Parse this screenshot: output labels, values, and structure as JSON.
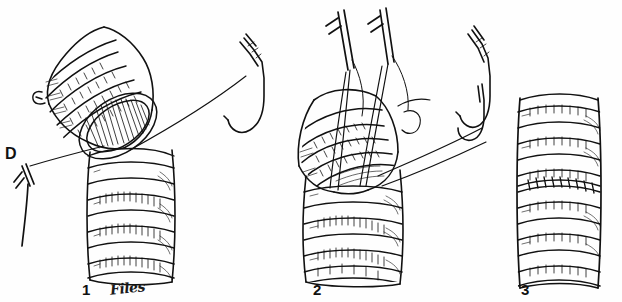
{
  "figure": {
    "width": 622,
    "height": 302,
    "background_color": "#fefefe",
    "ink_color": "#111111",
    "style": "pen-and-ink line drawing"
  },
  "labels": {
    "side_letter": "D",
    "panel_1": "1",
    "panel_2": "2",
    "panel_3": "3",
    "signature": "Files"
  },
  "panels": [
    {
      "number": "1",
      "caption_label": "1",
      "description": "Two cut tracheal ends angled apart; a suture strand runs from the anterior wall out to the right toward a curved needle, and to the left toward a needle marked D.",
      "elements": [
        "upper-tracheal-segment",
        "lower-tracheal-segment",
        "cut-lumen",
        "cartilage-rings",
        "suture-thread",
        "curved-needle-right",
        "needle-marker-d"
      ]
    },
    {
      "number": "2",
      "caption_label": "2",
      "description": "Tracheal ends being approximated; several suture strands with straight needles rise from the anastomotic line, and one strand passes to the right toward a curved needle.",
      "elements": [
        "upper-tracheal-segment",
        "lower-tracheal-segment",
        "cartilage-rings",
        "traction-sutures",
        "straight-needles",
        "suture-loop",
        "curved-needle-right"
      ]
    },
    {
      "number": "3",
      "caption_label": "3",
      "description": "Completed anastomosis: a straight, continuous trachea with evenly spaced cartilage rings and the suture line incorporated.",
      "elements": [
        "completed-trachea",
        "cartilage-rings",
        "anastomotic-suture-line"
      ]
    }
  ],
  "icons": {
    "needle": "curved-surgical-needle",
    "suture": "suture-thread"
  }
}
